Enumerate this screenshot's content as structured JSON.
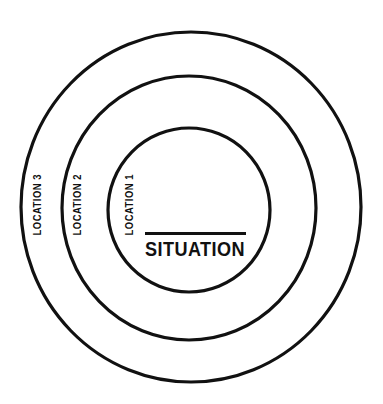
{
  "diagram": {
    "type": "concentric-circles",
    "title": "SITUATION",
    "background_color": "#ffffff",
    "stroke_color": "#111111",
    "center": {
      "label": "SITUATION",
      "has_underline_rule": true
    },
    "rings": [
      {
        "index": 1,
        "label": "LOCATION 1",
        "label_orientation": "vertical-bottom-to-top",
        "cx": 189,
        "cy": 210,
        "rx": 81,
        "ry": 82
      },
      {
        "index": 2,
        "label": "LOCATION 2",
        "label_orientation": "vertical-bottom-to-top",
        "cx": 189,
        "cy": 208,
        "rx": 127,
        "ry": 132
      },
      {
        "index": 3,
        "label": "LOCATION 3",
        "label_orientation": "vertical-bottom-to-top",
        "cx": 191,
        "cy": 207,
        "rx": 170,
        "ry": 175
      }
    ]
  }
}
